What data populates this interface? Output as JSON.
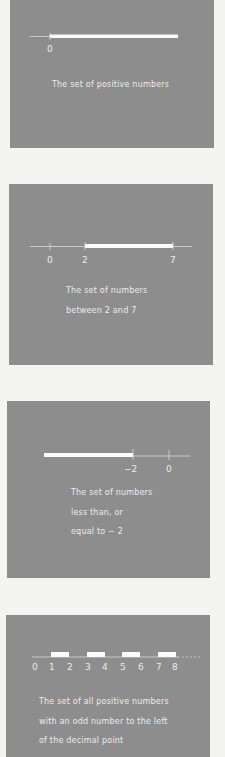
{
  "panels": [
    {
      "id": "positive-numbers",
      "caption_lines": [
        "The set of positive numbers"
      ],
      "number_line": {
        "ticks": [
          {
            "value": 0,
            "label": "0"
          }
        ],
        "highlighted": [
          {
            "from": 0,
            "to": "infinity"
          }
        ],
        "domain": [
          -0.6,
          4
        ]
      }
    },
    {
      "id": "between-2-and-7",
      "caption_lines": [
        "The set of numbers",
        "between 2 and 7"
      ],
      "number_line": {
        "ticks": [
          {
            "value": 0,
            "label": "0"
          },
          {
            "value": 2,
            "label": "2"
          },
          {
            "value": 7,
            "label": "7"
          }
        ],
        "highlighted": [
          {
            "from": 2,
            "to": 7
          }
        ],
        "domain": [
          -1,
          8
        ]
      }
    },
    {
      "id": "less-or-equal-minus-2",
      "caption_lines": [
        "The set of numbers",
        "less than, or",
        "equal to − 2"
      ],
      "number_line": {
        "ticks": [
          {
            "value": -2,
            "label": "−2"
          },
          {
            "value": 0,
            "label": "0"
          }
        ],
        "highlighted": [
          {
            "from": "-infinity",
            "to": -2
          }
        ],
        "domain": [
          -7,
          1
        ]
      }
    },
    {
      "id": "odd-integer-part",
      "caption_lines": [
        "The set of all positive numbers",
        "with an odd number to the left",
        "of the decimal point"
      ],
      "number_line": {
        "ticks": [
          {
            "value": 0,
            "label": "0"
          },
          {
            "value": 1,
            "label": "1"
          },
          {
            "value": 2,
            "label": "2"
          },
          {
            "value": 3,
            "label": "3"
          },
          {
            "value": 4,
            "label": "4"
          },
          {
            "value": 5,
            "label": "5"
          },
          {
            "value": 6,
            "label": "6"
          },
          {
            "value": 7,
            "label": "7"
          },
          {
            "value": 8,
            "label": "8"
          }
        ],
        "highlighted": [
          {
            "from": 1,
            "to": 2
          },
          {
            "from": 3,
            "to": 4
          },
          {
            "from": 5,
            "to": 6
          },
          {
            "from": 7,
            "to": 8
          }
        ],
        "continues": "dotted",
        "domain": [
          0,
          9
        ]
      }
    }
  ]
}
